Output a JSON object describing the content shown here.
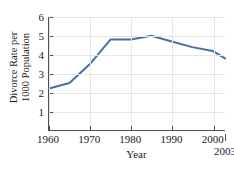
{
  "chart_data": {
    "type": "line",
    "title": "",
    "xlabel": "Year",
    "ylabel_line1": "Divorce Rate per",
    "ylabel_line2": "1000 Population",
    "xlim": [
      1960,
      2003
    ],
    "ylim": [
      0,
      6
    ],
    "grid": true,
    "legend": "none",
    "line_color": "#4a6fa5",
    "axis_color": "#4d4d4d",
    "grid_color": "#e6e6e6",
    "xticks": [
      1960,
      1970,
      1980,
      1990,
      2000
    ],
    "xtick_labels": [
      "1960",
      "1970",
      "1980",
      "1990",
      "2000"
    ],
    "yticks": [
      1,
      2,
      3,
      4,
      5,
      6
    ],
    "ytick_labels": [
      "1",
      "2",
      "3",
      "4",
      "5",
      "6"
    ],
    "end_annotation": {
      "x": 2003,
      "label": "2003"
    },
    "x": [
      1960,
      1965,
      1970,
      1975,
      1980,
      1985,
      1990,
      1995,
      2000,
      2003
    ],
    "values": [
      2.2,
      2.5,
      3.5,
      4.8,
      4.8,
      5.0,
      4.7,
      4.4,
      4.2,
      3.8
    ],
    "series": [
      {
        "name": "Divorce rate",
        "x": [
          1960,
          1965,
          1970,
          1975,
          1980,
          1985,
          1990,
          1995,
          2000,
          2003
        ],
        "values": [
          2.2,
          2.5,
          3.5,
          4.8,
          4.8,
          5.0,
          4.7,
          4.4,
          4.2,
          3.8
        ]
      }
    ]
  }
}
